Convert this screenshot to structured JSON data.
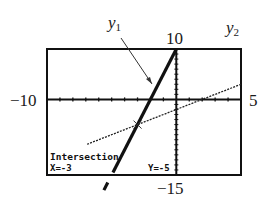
{
  "chart_data": {
    "type": "line",
    "title": "",
    "xlabel": "",
    "ylabel": "",
    "window": {
      "xmin": -10,
      "xmax": 5,
      "ymin": -15,
      "ymax": 10,
      "xscl": 1,
      "yscl": 1
    },
    "xlim": [
      -10,
      5
    ],
    "ylim": [
      -15,
      10
    ],
    "grid": false,
    "series": [
      {
        "name": "y1",
        "equation": "y = 5x + 10",
        "slope": 5,
        "intercept": 10,
        "style": "thick"
      },
      {
        "name": "y2",
        "equation": "y = x - 2",
        "slope": 1,
        "intercept": -2,
        "style": "dotted"
      }
    ],
    "annotations": {
      "intersection": {
        "x": -3,
        "y": -5
      }
    }
  },
  "labels": {
    "xmin": "−10",
    "xmax": "5",
    "ymax": "10",
    "ymin": "−15",
    "y1_base": "y",
    "y1_sub": "1",
    "y2_base": "y",
    "y2_sub": "2"
  },
  "calc_screen": {
    "title": "Intersection",
    "x_readout": "X=-3",
    "y_readout": "Y=-5"
  },
  "colors": {
    "ink": "#111111",
    "background": "#ffffff"
  }
}
